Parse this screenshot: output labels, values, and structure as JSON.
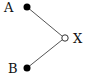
{
  "diagram": {
    "nodes": [
      {
        "id": "A",
        "label": "A",
        "style": "filled",
        "cx": 27,
        "cy": 7
      },
      {
        "id": "B",
        "label": "B",
        "style": "filled",
        "cx": 27,
        "cy": 68
      },
      {
        "id": "X",
        "label": "X",
        "style": "hollow",
        "cx": 65,
        "cy": 38
      }
    ],
    "edges": [
      {
        "from": "A",
        "to": "X"
      },
      {
        "from": "B",
        "to": "X"
      }
    ],
    "colors": {
      "line": "#555555",
      "node": "#000000",
      "background": "#ffffff"
    }
  }
}
